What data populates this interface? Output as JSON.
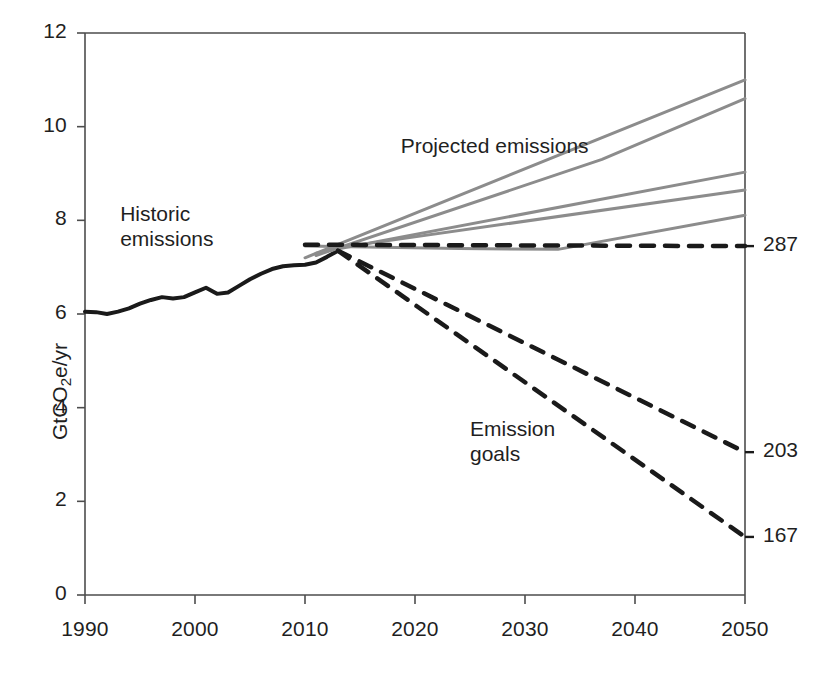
{
  "chart_data": {
    "type": "line",
    "title": "",
    "xlabel": "",
    "ylabel": "GtCO2e/yr",
    "ylabel_parts": {
      "pre": "GtCO",
      "sub": "2",
      "post": "e/yr"
    },
    "xlim": [
      1990,
      2050
    ],
    "ylim": [
      0,
      12
    ],
    "grid": false,
    "legend": "none",
    "xticks": [
      1990,
      2000,
      2010,
      2020,
      2030,
      2040,
      2050
    ],
    "yticks": [
      0,
      2,
      4,
      6,
      8,
      10,
      12
    ],
    "annotations": [
      {
        "text": "Historic\nemissions",
        "x": 1993.2,
        "y": 8.05
      },
      {
        "text": "Projected emissions",
        "x": 2018.7,
        "y": 9.5
      },
      {
        "text": "Emission\ngoals",
        "x": 2025.0,
        "y": 3.45
      }
    ],
    "end_labels": [
      {
        "text": "287",
        "value": 7.45,
        "series": "reference-dashed"
      },
      {
        "text": "203",
        "value": 3.05,
        "series": "goal-203"
      },
      {
        "text": "167",
        "value": 1.24,
        "series": "goal-167"
      }
    ],
    "series": [
      {
        "name": "Historic emissions",
        "style": "solid",
        "color": "#1a1a1a",
        "width": 4.0,
        "points": [
          [
            1990,
            6.05
          ],
          [
            1991,
            6.04
          ],
          [
            1992,
            6.0
          ],
          [
            1993,
            6.05
          ],
          [
            1994,
            6.12
          ],
          [
            1995,
            6.22
          ],
          [
            1996,
            6.3
          ],
          [
            1997,
            6.36
          ],
          [
            1998,
            6.33
          ],
          [
            1999,
            6.36
          ],
          [
            2000,
            6.46
          ],
          [
            2001,
            6.56
          ],
          [
            2002,
            6.43
          ],
          [
            2003,
            6.46
          ],
          [
            2004,
            6.6
          ],
          [
            2005,
            6.74
          ],
          [
            2006,
            6.86
          ],
          [
            2007,
            6.96
          ],
          [
            2008,
            7.02
          ],
          [
            2009,
            7.04
          ],
          [
            2010,
            7.05
          ],
          [
            2011,
            7.1
          ],
          [
            2012,
            7.22
          ],
          [
            2013,
            7.35
          ]
        ]
      },
      {
        "name": "Projection A (highest)",
        "style": "solid",
        "color": "#8c8c8c",
        "width": 3.0,
        "points": [
          [
            2010,
            7.2
          ],
          [
            2050,
            11.0
          ]
        ]
      },
      {
        "name": "Projection B",
        "style": "solid",
        "color": "#8c8c8c",
        "width": 3.0,
        "points": [
          [
            2011,
            7.25
          ],
          [
            2037,
            9.3
          ],
          [
            2050,
            10.6
          ]
        ]
      },
      {
        "name": "Projection C",
        "style": "solid",
        "color": "#8c8c8c",
        "width": 3.0,
        "points": [
          [
            2011,
            7.3
          ],
          [
            2050,
            9.03
          ]
        ]
      },
      {
        "name": "Projection D",
        "style": "solid",
        "color": "#8c8c8c",
        "width": 3.0,
        "points": [
          [
            2012,
            7.38
          ],
          [
            2050,
            8.65
          ]
        ]
      },
      {
        "name": "Projection E (lowest)",
        "style": "solid",
        "color": "#8c8c8c",
        "width": 3.0,
        "points": [
          [
            2010,
            7.45
          ],
          [
            2024,
            7.4
          ],
          [
            2033,
            7.38
          ],
          [
            2050,
            8.11
          ]
        ]
      },
      {
        "name": "Reference 287 (flat)",
        "style": "dashed",
        "color": "#1a1a1a",
        "width": 4.5,
        "points": [
          [
            2010,
            7.48
          ],
          [
            2050,
            7.45
          ]
        ]
      },
      {
        "name": "Emission goal 203",
        "style": "dashed",
        "color": "#1a1a1a",
        "width": 4.5,
        "points": [
          [
            2013,
            7.35
          ],
          [
            2050,
            3.05
          ]
        ]
      },
      {
        "name": "Emission goal 167",
        "style": "dashed",
        "color": "#1a1a1a",
        "width": 4.5,
        "points": [
          [
            2013,
            7.35
          ],
          [
            2050,
            1.24
          ]
        ]
      }
    ]
  },
  "axes": {
    "frame_color": "#4d4d4d"
  }
}
